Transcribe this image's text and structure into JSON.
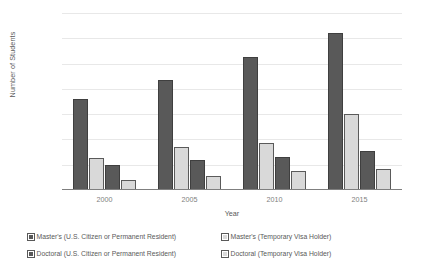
{
  "chart_data": {
    "type": "bar",
    "title": "",
    "xlabel": "Year",
    "ylabel": "Number of Students",
    "categories": [
      "2000",
      "2005",
      "2010",
      "2015"
    ],
    "series": [
      {
        "name": "Master's (U.S. Citizen or Permanent Resident)",
        "color": "#595959",
        "fill": "dark",
        "values": [
          72000,
          87000,
          105000,
          124000
        ]
      },
      {
        "name": "Master's (Temporary Visa Holder)",
        "color": "#d9d9d9",
        "fill": "light",
        "values": [
          25000,
          34000,
          37000,
          60000
        ]
      },
      {
        "name": "Doctoral (U.S. Citizen or Permanent Resident)",
        "color": "#595959",
        "fill": "dark",
        "values": [
          20000,
          24000,
          26000,
          31000
        ]
      },
      {
        "name": "Doctoral (Temporary Visa Holder)",
        "color": "#d9d9d9",
        "fill": "light",
        "values": [
          8000,
          11000,
          15000,
          17000
        ]
      }
    ],
    "ylim": [
      0,
      140000
    ],
    "ytick_values": [
      0,
      20000,
      40000,
      60000,
      80000,
      100000,
      120000,
      140000
    ],
    "ytick_labels": [
      "0",
      "20,000",
      "40,000",
      "60,000",
      "80,000",
      "100,000",
      "120,000",
      "140,000"
    ],
    "grid": true,
    "grid_axis": "y",
    "legend_position": "bottom",
    "legend_columns": 2
  },
  "axes": {
    "y_title": "Number of Students",
    "x_title": "Year"
  },
  "colors": {
    "dark_series": "#595959",
    "light_series": "#d9d9d9",
    "gridline": "#e8e8e8",
    "axis": "#7f7f7f",
    "text": "#595959",
    "tick_text": "#808080",
    "background": "#ffffff"
  }
}
